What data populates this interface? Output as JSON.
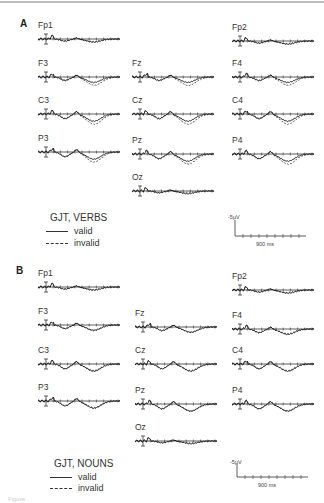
{
  "figure": {
    "caption_partial": "Figure"
  },
  "panels": [
    {
      "id": "A",
      "label": "A",
      "legend": {
        "title": "GJT, VERBS",
        "valid": "valid",
        "invalid": "invalid"
      },
      "scale": {
        "amplitude": "-5μV",
        "time": "900 ms"
      },
      "electrodes": [
        "Fp1",
        "Fp2",
        "F3",
        "Fz",
        "F4",
        "C3",
        "Cz",
        "C4",
        "P3",
        "Pz",
        "P4",
        "Oz"
      ]
    },
    {
      "id": "B",
      "label": "B",
      "legend": {
        "title": "GJT, NOUNS",
        "valid": "valid",
        "invalid": "invalid"
      },
      "scale": {
        "amplitude": "-5μV",
        "time": "900 ms"
      },
      "electrodes": [
        "Fp1",
        "Fp2",
        "F3",
        "Fz",
        "F4",
        "C3",
        "Cz",
        "C4",
        "P3",
        "Pz",
        "P4",
        "Oz"
      ]
    }
  ],
  "chart_data": [
    {
      "type": "line",
      "title": "A: GJT, VERBS",
      "xlabel": "Time (ms)",
      "ylabel": "Amplitude (μV), negative up",
      "xlim": [
        0,
        900
      ],
      "scale_bar": {
        "y": "-5 μV",
        "x": "900 ms"
      },
      "legend": [
        "valid (solid)",
        "invalid (dashed)"
      ],
      "electrodes": [
        "Fp1",
        "Fp2",
        "F3",
        "Fz",
        "F4",
        "C3",
        "Cz",
        "C4",
        "P3",
        "Pz",
        "P4",
        "Oz"
      ],
      "series": [
        {
          "name": "valid",
          "style": "solid"
        },
        {
          "name": "invalid",
          "style": "dashed"
        }
      ],
      "notes": "ERP waveforms per electrode; invalid diverges from valid after ~400 ms, largest at central/parietal sites"
    },
    {
      "type": "line",
      "title": "B: GJT, NOUNS",
      "xlabel": "Time (ms)",
      "ylabel": "Amplitude (μV), negative up",
      "xlim": [
        0,
        900
      ],
      "scale_bar": {
        "y": "-5 μV",
        "x": "900 ms"
      },
      "legend": [
        "valid (solid)",
        "invalid (dashed)"
      ],
      "electrodes": [
        "Fp1",
        "Fp2",
        "F3",
        "Fz",
        "F4",
        "C3",
        "Cz",
        "C4",
        "P3",
        "Pz",
        "P4",
        "Oz"
      ],
      "series": [
        {
          "name": "valid",
          "style": "solid"
        },
        {
          "name": "invalid",
          "style": "dashed"
        }
      ],
      "notes": "ERP waveforms per electrode; valid and invalid largely overlap"
    }
  ]
}
